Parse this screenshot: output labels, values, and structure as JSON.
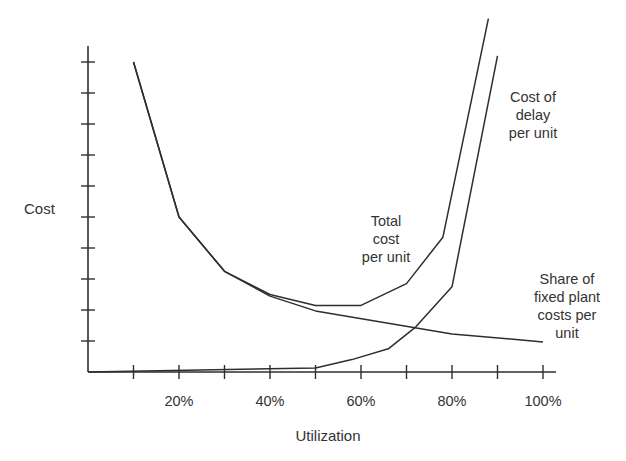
{
  "chart_data": {
    "type": "line",
    "title": "",
    "xlabel": "Utilization",
    "ylabel": "Cost",
    "x_tick_labels": [
      "20%",
      "40%",
      "60%",
      "80%",
      "100%"
    ],
    "x_ticks": [
      10,
      20,
      30,
      40,
      50,
      60,
      70,
      80,
      90,
      100
    ],
    "y_tick_count": 10,
    "y_ticks_labeled": false,
    "xlim": [
      0,
      100
    ],
    "ylim": [
      0,
      10.5
    ],
    "grid": false,
    "legend": "inline annotations",
    "series": [
      {
        "name": "Total cost per unit",
        "label_lines": [
          "Total",
          "cost",
          "per unit"
        ],
        "x": [
          10,
          20,
          30,
          40,
          50,
          60,
          70,
          78,
          88
        ],
        "y": [
          10.0,
          5.0,
          3.25,
          2.5,
          2.15,
          2.15,
          2.85,
          4.35,
          11.4
        ]
      },
      {
        "name": "Cost of delay per unit",
        "label_lines": [
          "Cost of",
          "delay",
          "per unit"
        ],
        "x": [
          0,
          50,
          58,
          66,
          72,
          80,
          90
        ],
        "y": [
          0.0,
          0.13,
          0.4,
          0.75,
          1.45,
          2.75,
          10.2
        ]
      },
      {
        "name": "Share of fixed plant costs per unit",
        "label_lines": [
          "Share of",
          "fixed plant",
          "costs per",
          "unit"
        ],
        "x": [
          10,
          20,
          30,
          40,
          50,
          80,
          100
        ],
        "y": [
          10.0,
          5.0,
          3.25,
          2.45,
          1.97,
          1.23,
          0.97
        ]
      }
    ]
  },
  "axes": {
    "ylabel": "Cost",
    "xlabel": "Utilization",
    "x_tick_labels": [
      {
        "text": "20%",
        "x": 20
      },
      {
        "text": "40%",
        "x": 40
      },
      {
        "text": "60%",
        "x": 60
      },
      {
        "text": "80%",
        "x": 80
      },
      {
        "text": "100%",
        "x": 100
      }
    ]
  },
  "annotations": {
    "total": [
      "Total",
      "cost",
      "per unit"
    ],
    "delay": [
      "Cost of",
      "delay",
      "per unit"
    ],
    "fixed": [
      "Share of",
      "fixed plant",
      "costs per",
      "unit"
    ]
  },
  "colors": {
    "line": "#2e2e2e",
    "axis": "#2e2e2e",
    "text": "#333333",
    "background": "#ffffff"
  }
}
